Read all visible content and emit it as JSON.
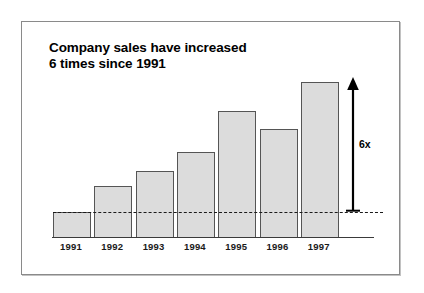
{
  "chart_data": {
    "type": "bar",
    "title": "Company sales have increased\n6 times since 1991",
    "xlabel": "",
    "ylabel": "",
    "grid": false,
    "legend": "none",
    "categories": [
      "1991",
      "1992",
      "1993",
      "1994",
      "1995",
      "1996",
      "1997"
    ],
    "values": [
      1.0,
      2.0,
      2.6,
      3.3,
      4.9,
      4.2,
      6.0
    ],
    "value_unit": "relative sales (1991 = 1)",
    "ylim": [
      0,
      6.4
    ],
    "annotations": [
      {
        "name": "growth-arrow",
        "label": "6x",
        "from_category": "1991",
        "to_category": "1997",
        "description": "double-ended vertical arrow from the 1991 reference level to the 1997 bar top"
      },
      {
        "name": "reference-line",
        "label": "",
        "style": "dashed",
        "at_value": 1.0,
        "description": "dashed horizontal line marking the 1991 sales level"
      }
    ]
  },
  "chart": {
    "title_line_1": "Company sales have increased",
    "title_line_2": "6 times since 1991",
    "growth_label": "6x",
    "colors": {
      "bar_fill": "#dcdcdc",
      "bar_edge": "#555555",
      "axis": "#3a3a3a",
      "reference_line": "#1a1a1a",
      "frame": "#8a8a8a",
      "background": "#ffffff",
      "text": "#000000"
    },
    "ticks": [
      {
        "label": "1991"
      },
      {
        "label": "1992"
      },
      {
        "label": "1993"
      },
      {
        "label": "1994"
      },
      {
        "label": "1995"
      },
      {
        "label": "1996"
      },
      {
        "label": "1997"
      }
    ]
  }
}
